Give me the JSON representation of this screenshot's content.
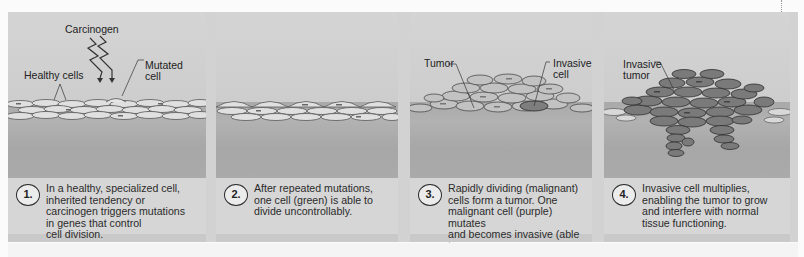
{
  "figure": {
    "colors": {
      "background": "#fbfbfb",
      "panel": "#c9c9c9",
      "caption_box": "#d6d6d6",
      "tissue": "#aaaaaa",
      "cell_fill": "#e2e2e2",
      "cell_outline": "#555555",
      "tumor_cell_fill": "#8a8a8a",
      "text": "#2b2b2b"
    },
    "panels": [
      {
        "step": "1.",
        "labels": {
          "carcinogen": "Carcinogen",
          "healthy_cells": "Healthy cells",
          "mutated_cell": "Mutated\ncell"
        },
        "caption": "In a healthy, specialized cell,\ninherited tendency or\ncarcinogen triggers mutations\nin genes that control\ncell division."
      },
      {
        "step": "2.",
        "labels": {},
        "caption": "After repeated mutations,\none cell (green) is able to\ndivide uncontrollably."
      },
      {
        "step": "3.",
        "labels": {
          "tumor": "Tumor",
          "invasive_cell": "Invasive\ncell"
        },
        "caption": "Rapidly dividing (malignant)\ncells form a tumor. One\nmalignant cell (purple) mutates\nand becomes invasive (able to\ninvade underlying tissues)."
      },
      {
        "step": "4.",
        "labels": {
          "invasive_tumor": "Invasive\ntumor"
        },
        "caption": "Invasive cell multiplies,\nenabling the tumor to grow\nand interfere with normal\ntissue functioning."
      }
    ]
  }
}
